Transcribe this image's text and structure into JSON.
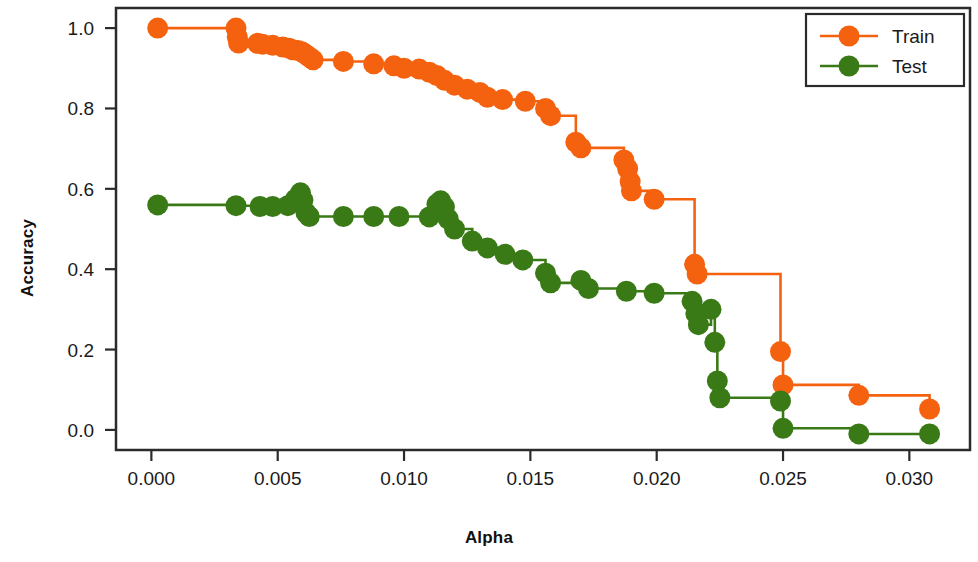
{
  "chart_data": {
    "type": "line",
    "title": "",
    "xlabel": "Alpha",
    "ylabel": "Accuracy",
    "xlim": [
      -0.0014,
      0.0324
    ],
    "ylim": [
      -0.05,
      1.05
    ],
    "grid": false,
    "drawstyle": "steps-post",
    "legend_position": "upper right",
    "xticks": [
      0.0,
      0.005,
      0.01,
      0.015,
      0.02,
      0.025,
      0.03
    ],
    "xticklabels": [
      "0.000",
      "0.005",
      "0.010",
      "0.015",
      "0.020",
      "0.025",
      "0.030"
    ],
    "yticks": [
      0.0,
      0.2,
      0.4,
      0.6,
      0.8,
      1.0
    ],
    "yticklabels": [
      "0.0",
      "0.2",
      "0.4",
      "0.6",
      "0.8",
      "1.0"
    ],
    "series": [
      {
        "name": "Train",
        "color": "#F4620F",
        "marker": "o",
        "points": [
          [
            0.00025,
            1.0
          ],
          [
            0.00335,
            1.0
          ],
          [
            0.0034,
            0.978
          ],
          [
            0.00345,
            0.963
          ],
          [
            0.0042,
            0.962
          ],
          [
            0.0044,
            0.96
          ],
          [
            0.0048,
            0.957
          ],
          [
            0.0052,
            0.953
          ],
          [
            0.00545,
            0.95
          ],
          [
            0.0056,
            0.946
          ],
          [
            0.0058,
            0.944
          ],
          [
            0.00595,
            0.941
          ],
          [
            0.0061,
            0.935
          ],
          [
            0.00625,
            0.928
          ],
          [
            0.0064,
            0.921
          ],
          [
            0.0076,
            0.917
          ],
          [
            0.0088,
            0.911
          ],
          [
            0.0096,
            0.906
          ],
          [
            0.01,
            0.9
          ],
          [
            0.0106,
            0.898
          ],
          [
            0.011,
            0.89
          ],
          [
            0.0113,
            0.882
          ],
          [
            0.0116,
            0.87
          ],
          [
            0.012,
            0.858
          ],
          [
            0.0125,
            0.848
          ],
          [
            0.013,
            0.84
          ],
          [
            0.0133,
            0.828
          ],
          [
            0.0139,
            0.822
          ],
          [
            0.0148,
            0.818
          ],
          [
            0.0156,
            0.8
          ],
          [
            0.0158,
            0.782
          ],
          [
            0.0168,
            0.716
          ],
          [
            0.017,
            0.702
          ],
          [
            0.0187,
            0.672
          ],
          [
            0.01885,
            0.65
          ],
          [
            0.01895,
            0.618
          ],
          [
            0.019,
            0.595
          ],
          [
            0.0199,
            0.574
          ],
          [
            0.0215,
            0.412
          ],
          [
            0.0216,
            0.388
          ],
          [
            0.0249,
            0.195
          ],
          [
            0.025,
            0.112
          ],
          [
            0.028,
            0.086
          ],
          [
            0.0308,
            0.052
          ]
        ]
      },
      {
        "name": "Test",
        "color": "#3A7A16",
        "marker": "o",
        "points": [
          [
            0.00025,
            0.56
          ],
          [
            0.00335,
            0.558
          ],
          [
            0.0043,
            0.556
          ],
          [
            0.0048,
            0.556
          ],
          [
            0.0054,
            0.558
          ],
          [
            0.0057,
            0.574
          ],
          [
            0.0059,
            0.59
          ],
          [
            0.006,
            0.572
          ],
          [
            0.00612,
            0.54
          ],
          [
            0.00625,
            0.531
          ],
          [
            0.0076,
            0.531
          ],
          [
            0.0088,
            0.531
          ],
          [
            0.0098,
            0.531
          ],
          [
            0.011,
            0.53
          ],
          [
            0.0113,
            0.562
          ],
          [
            0.01145,
            0.57
          ],
          [
            0.0116,
            0.555
          ],
          [
            0.01175,
            0.525
          ],
          [
            0.012,
            0.5
          ],
          [
            0.0127,
            0.47
          ],
          [
            0.0133,
            0.453
          ],
          [
            0.014,
            0.437
          ],
          [
            0.0147,
            0.423
          ],
          [
            0.0156,
            0.39
          ],
          [
            0.0158,
            0.366
          ],
          [
            0.017,
            0.372
          ],
          [
            0.0173,
            0.352
          ],
          [
            0.0188,
            0.345
          ],
          [
            0.0199,
            0.34
          ],
          [
            0.0214,
            0.32
          ],
          [
            0.02155,
            0.29
          ],
          [
            0.02165,
            0.262
          ],
          [
            0.02215,
            0.3
          ],
          [
            0.0223,
            0.218
          ],
          [
            0.0224,
            0.122
          ],
          [
            0.0225,
            0.08
          ],
          [
            0.0249,
            0.072
          ],
          [
            0.025,
            0.004
          ],
          [
            0.028,
            -0.01
          ],
          [
            0.0308,
            -0.01
          ]
        ]
      }
    ]
  },
  "legend": {
    "entries": [
      {
        "label": "Train",
        "color": "#F4620F"
      },
      {
        "label": "Test",
        "color": "#3A7A16"
      }
    ]
  }
}
